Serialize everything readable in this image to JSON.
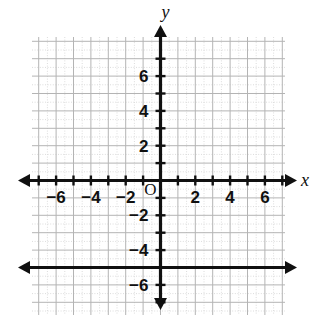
{
  "chart_data": {
    "type": "line",
    "title": "",
    "xlabel": "x",
    "ylabel": "y",
    "xlim": [
      -7.5,
      7.5
    ],
    "ylim": [
      -7.5,
      7.5
    ],
    "grid": true,
    "legend": "none",
    "origin_label": "O",
    "x_ticks": [
      -6,
      -4,
      -2,
      2,
      4,
      6
    ],
    "y_ticks": [
      6,
      4,
      2,
      -2,
      -4,
      -6
    ],
    "x_tick_labels": [
      "−6",
      "−4",
      "−2",
      "2",
      "4",
      "6"
    ],
    "y_tick_labels": [
      "6",
      "4",
      "2",
      "−2",
      "−4",
      "−6"
    ],
    "series": [
      {
        "name": "y = -5",
        "type": "line",
        "equation": "y = −5",
        "x": [
          -7.5,
          7.5
        ],
        "values": [
          -5,
          -5
        ],
        "arrow_start": true,
        "arrow_end": true,
        "color": "#101010"
      }
    ]
  },
  "axes": {
    "x_axis_name": "x",
    "y_axis_name": "y",
    "origin_label": "O",
    "x_labels": [
      {
        "value": -6,
        "text": "−6"
      },
      {
        "value": -4,
        "text": "−4"
      },
      {
        "value": -2,
        "text": "−2"
      },
      {
        "value": 2,
        "text": "2"
      },
      {
        "value": 4,
        "text": "4"
      },
      {
        "value": 6,
        "text": "6"
      }
    ],
    "y_labels": [
      {
        "value": 6,
        "text": "6"
      },
      {
        "value": 4,
        "text": "4"
      },
      {
        "value": 2,
        "text": "2"
      },
      {
        "value": -2,
        "text": "−2"
      },
      {
        "value": -4,
        "text": "−4"
      },
      {
        "value": -6,
        "text": "−6"
      }
    ]
  },
  "colors": {
    "background": "#ffffff",
    "grid_major": "#b4b4b4",
    "grid_minor": "#dcdcdc",
    "ink": "#101010"
  }
}
